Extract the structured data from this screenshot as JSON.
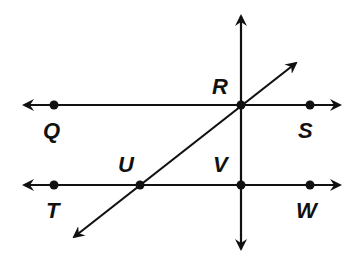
{
  "diagram": {
    "type": "geometry-lines",
    "stroke_color": "#111111",
    "background": "#ffffff",
    "lines": [
      {
        "id": "line-QS",
        "through": [
          "Q",
          "R",
          "S"
        ],
        "orientation": "horizontal"
      },
      {
        "id": "line-TW",
        "through": [
          "T",
          "U",
          "V",
          "W"
        ],
        "orientation": "horizontal"
      },
      {
        "id": "line-RV",
        "through": [
          "R",
          "V"
        ],
        "orientation": "vertical"
      },
      {
        "id": "line-UR",
        "through": [
          "U",
          "R"
        ],
        "orientation": "diagonal"
      }
    ],
    "points": [
      {
        "name": "Q",
        "label": "Q"
      },
      {
        "name": "R",
        "label": "R"
      },
      {
        "name": "S",
        "label": "S"
      },
      {
        "name": "T",
        "label": "T"
      },
      {
        "name": "U",
        "label": "U"
      },
      {
        "name": "V",
        "label": "V"
      },
      {
        "name": "W",
        "label": "W"
      }
    ]
  }
}
